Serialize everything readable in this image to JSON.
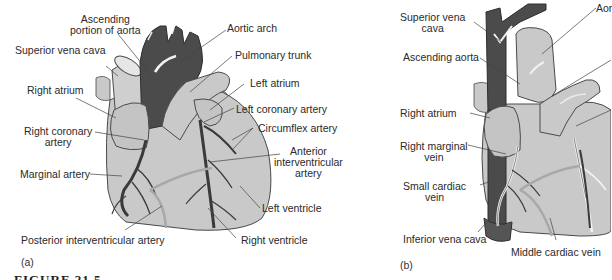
{
  "figure": {
    "caption_partial": "FIGURE 21.5",
    "colors": {
      "heart_fill": "#c9c9c9",
      "heart_outline": "#4a4a4a",
      "aorta_dark": "#4b4b4b",
      "vessel_dark": "#3a3a3a",
      "vein_white": "#f4f4f4",
      "leader_line": "#444444",
      "background": "#ffffff"
    }
  },
  "panel_a": {
    "tag": "(a)",
    "labels": {
      "ascending_aorta": [
        "Ascending",
        "portion of aorta"
      ],
      "superior_vena_cava": "Superior vena cava",
      "right_atrium": "Right atrium",
      "right_coronary_artery": [
        "Right coronary",
        "artery"
      ],
      "marginal_artery": "Marginal artery",
      "posterior_interventricular_artery": "Posterior interventricular artery",
      "aortic_arch": "Aortic arch",
      "pulmonary_trunk": "Pulmonary trunk",
      "left_atrium": "Left atrium",
      "left_coronary_artery": "Left coronary artery",
      "circumflex_artery": "Circumflex artery",
      "anterior_interventricular_artery": [
        "Anterior",
        "interventricular",
        "artery"
      ],
      "left_ventricle": "Left ventricle",
      "right_ventricle": "Right ventricle"
    }
  },
  "panel_b": {
    "tag": "(b)",
    "labels": {
      "superior_vena_cava": [
        "Superior vena",
        "cava"
      ],
      "ascending_aorta": "Ascending aorta",
      "right_atrium": "Right atrium",
      "right_marginal_vein": [
        "Right marginal",
        "vein"
      ],
      "small_cardiac_vein": [
        "Small cardiac",
        "vein"
      ],
      "inferior_vena_cava": "Inferior vena cava",
      "middle_cardiac_vein": "Middle cardiac vein",
      "aorta_cut": "Aor"
    }
  }
}
